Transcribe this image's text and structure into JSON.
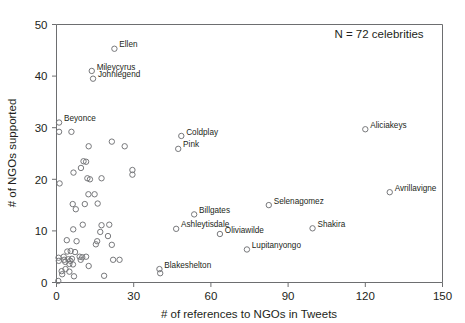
{
  "chart_data": {
    "type": "scatter",
    "title": "",
    "xlabel": "# of references to NGOs in Tweets",
    "ylabel": "# of NGOs supported",
    "xlim": [
      0,
      150
    ],
    "ylim": [
      0,
      50
    ],
    "xticks": [
      0,
      30,
      60,
      90,
      120,
      150
    ],
    "yticks": [
      0,
      10,
      20,
      30,
      40,
      50
    ],
    "grid": false,
    "legend": null,
    "annotations": [
      {
        "text": "N = 72 celebrities",
        "x": 120,
        "y": 47.5
      }
    ],
    "marker_style": "open-circle",
    "marker_color": "#77787b",
    "labeled_points": [
      {
        "label": "Ellen",
        "x": 22.5,
        "y": 45.3,
        "label_side": "right"
      },
      {
        "label": "Mileycyrus",
        "x": 13.7,
        "y": 41.0,
        "label_side": "right"
      },
      {
        "label": "Johnlegend",
        "x": 14.2,
        "y": 39.5,
        "label_side": "right"
      },
      {
        "label": "Beyonce",
        "x": 1.0,
        "y": 31.0,
        "label_side": "right"
      },
      {
        "label": "Coldplay",
        "x": 48.5,
        "y": 28.4,
        "label_side": "right"
      },
      {
        "label": "Pink",
        "x": 47.3,
        "y": 25.9,
        "label_side": "right"
      },
      {
        "label": "Aliciakeys",
        "x": 120.0,
        "y": 29.7,
        "label_side": "right"
      },
      {
        "label": "Avrillavigne",
        "x": 129.5,
        "y": 17.5,
        "label_side": "right"
      },
      {
        "label": "Billgates",
        "x": 53.5,
        "y": 13.2,
        "label_side": "right"
      },
      {
        "label": "Selenagomez",
        "x": 82.5,
        "y": 15.0,
        "label_side": "right"
      },
      {
        "label": "Ashleytisdale",
        "x": 46.5,
        "y": 10.4,
        "label_side": "right"
      },
      {
        "label": "Oliviawilde",
        "x": 63.5,
        "y": 9.4,
        "label_side": "right"
      },
      {
        "label": "Shakira",
        "x": 99.5,
        "y": 10.5,
        "label_side": "right"
      },
      {
        "label": "Lupitanyongo",
        "x": 74.0,
        "y": 6.4,
        "label_side": "right"
      },
      {
        "label": "Blakeshelton",
        "x": 40.0,
        "y": 2.6,
        "label_side": "right"
      },
      {
        "label": "",
        "x": 40.3,
        "y": 1.8,
        "label_side": "none"
      }
    ],
    "unlabeled_points": [
      {
        "x": 1.0,
        "y": 29.2
      },
      {
        "x": 5.8,
        "y": 29.2
      },
      {
        "x": 1.2,
        "y": 19.2
      },
      {
        "x": 6.6,
        "y": 21.3
      },
      {
        "x": 10.5,
        "y": 23.5
      },
      {
        "x": 11.5,
        "y": 23.4
      },
      {
        "x": 9.5,
        "y": 22.2
      },
      {
        "x": 12.0,
        "y": 20.2
      },
      {
        "x": 13.0,
        "y": 20.0
      },
      {
        "x": 17.5,
        "y": 20.2
      },
      {
        "x": 12.5,
        "y": 26.4
      },
      {
        "x": 21.5,
        "y": 27.3
      },
      {
        "x": 26.5,
        "y": 26.4
      },
      {
        "x": 29.5,
        "y": 21.8
      },
      {
        "x": 29.5,
        "y": 20.9
      },
      {
        "x": 6.3,
        "y": 15.2
      },
      {
        "x": 7.5,
        "y": 14.2
      },
      {
        "x": 11.0,
        "y": 15.2
      },
      {
        "x": 12.4,
        "y": 17.1
      },
      {
        "x": 14.8,
        "y": 17.1
      },
      {
        "x": 16.0,
        "y": 15.3
      },
      {
        "x": 6.5,
        "y": 10.3
      },
      {
        "x": 10.2,
        "y": 11.2
      },
      {
        "x": 17.5,
        "y": 11.1
      },
      {
        "x": 20.5,
        "y": 11.2
      },
      {
        "x": 17.0,
        "y": 9.8
      },
      {
        "x": 20.0,
        "y": 9.0
      },
      {
        "x": 4.0,
        "y": 8.2
      },
      {
        "x": 7.8,
        "y": 8.0
      },
      {
        "x": 15.3,
        "y": 7.4
      },
      {
        "x": 15.8,
        "y": 8.0
      },
      {
        "x": 21.5,
        "y": 7.3
      },
      {
        "x": 4.2,
        "y": 6.0
      },
      {
        "x": 5.5,
        "y": 6.1
      },
      {
        "x": 7.2,
        "y": 5.9
      },
      {
        "x": 2.8,
        "y": 5.0
      },
      {
        "x": 0.8,
        "y": 4.8
      },
      {
        "x": 0.9,
        "y": 4.2
      },
      {
        "x": 3.0,
        "y": 4.4
      },
      {
        "x": 3.4,
        "y": 4.0
      },
      {
        "x": 4.6,
        "y": 4.5
      },
      {
        "x": 5.4,
        "y": 4.2
      },
      {
        "x": 6.0,
        "y": 4.6
      },
      {
        "x": 5.0,
        "y": 3.6
      },
      {
        "x": 6.4,
        "y": 3.5
      },
      {
        "x": 9.0,
        "y": 5.0
      },
      {
        "x": 10.0,
        "y": 4.9
      },
      {
        "x": 11.5,
        "y": 5.0
      },
      {
        "x": 9.4,
        "y": 4.4
      },
      {
        "x": 22.0,
        "y": 4.4
      },
      {
        "x": 24.5,
        "y": 4.4
      },
      {
        "x": 12.5,
        "y": 3.2
      },
      {
        "x": 3.5,
        "y": 2.6
      },
      {
        "x": 5.0,
        "y": 2.1
      },
      {
        "x": 2.0,
        "y": 2.2
      },
      {
        "x": 2.2,
        "y": 1.6
      },
      {
        "x": 6.8,
        "y": 1.2
      },
      {
        "x": 18.5,
        "y": 1.3
      },
      {
        "x": 0.7,
        "y": 0.3
      }
    ]
  },
  "axes": {
    "x_title": "# of references to NGOs in Tweets",
    "y_title": "# of NGOs supported",
    "x_tick_labels": [
      "0",
      "30",
      "60",
      "90",
      "120",
      "150"
    ],
    "y_tick_labels": [
      "0",
      "10",
      "20",
      "30",
      "40",
      "50"
    ]
  },
  "annotation": {
    "sample_size_text": "N = 72 celebrities"
  },
  "colors": {
    "marker_stroke": "#77787b",
    "axis_stroke": "#6d6e70",
    "text": "#231f20",
    "background": "#ffffff"
  }
}
